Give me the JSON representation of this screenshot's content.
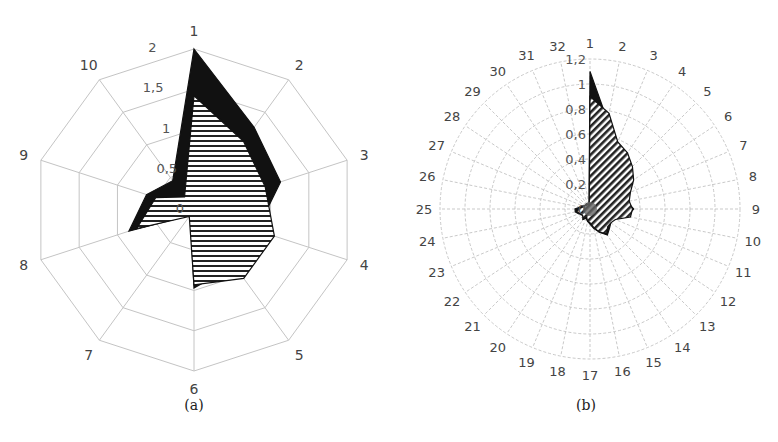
{
  "chart_data": [
    {
      "id": "a",
      "type": "radar",
      "caption": "(a)",
      "categories": [
        "1",
        "2",
        "3",
        "4",
        "5",
        "6",
        "7",
        "8",
        "9",
        "10"
      ],
      "radial_ticks": [
        "0",
        "0,5",
        "1",
        "1,5",
        "2"
      ],
      "rmax": 2,
      "grid": "polygon",
      "series": [
        {
          "name": "series-solid",
          "fill": "black",
          "values": [
            2.0,
            1.27,
            1.13,
            0.82,
            0.85,
            0.97,
            0.08,
            0.85,
            0.62,
            0.45
          ]
        },
        {
          "name": "series-hatched",
          "fill": "horizontal-hatch",
          "values": [
            1.42,
            1.05,
            0.93,
            1.05,
            1.05,
            0.93,
            0.1,
            0.75,
            0.5,
            0.2
          ]
        }
      ]
    },
    {
      "id": "b",
      "type": "radar",
      "caption": "(b)",
      "categories": [
        "1",
        "2",
        "3",
        "4",
        "5",
        "6",
        "7",
        "8",
        "9",
        "10",
        "11",
        "12",
        "13",
        "14",
        "15",
        "16",
        "17",
        "18",
        "19",
        "20",
        "21",
        "22",
        "23",
        "24",
        "25",
        "26",
        "27",
        "28",
        "29",
        "30",
        "31",
        "32"
      ],
      "radial_ticks": [
        "0",
        "0,2",
        "0,4",
        "0,6",
        "0,8",
        "1",
        "1,2"
      ],
      "rmax": 1.2,
      "grid": "circle-dashed",
      "series": [
        {
          "name": "series-solid",
          "fill": "black",
          "values": [
            1.1,
            0.72,
            0.55,
            0.5,
            0.45,
            0.4,
            0.33,
            0.3,
            0.35,
            0.3,
            0.2,
            0.2,
            0.22,
            0.25,
            0.2,
            0.16,
            0.12,
            0.1,
            0.08,
            0.1,
            0.08,
            0.08,
            0.1,
            0.12,
            0.12,
            0.08,
            0.06,
            0.05,
            0.05,
            0.05,
            0.04,
            0.04
          ]
        },
        {
          "name": "series-hatched",
          "fill": "diagonal-hatch",
          "values": [
            0.9,
            0.78,
            0.58,
            0.54,
            0.48,
            0.42,
            0.35,
            0.32,
            0.34,
            0.33,
            0.22,
            0.2,
            0.2,
            0.24,
            0.2,
            0.15,
            0.11,
            0.1,
            0.07,
            0.1,
            0.08,
            0.08,
            0.09,
            0.11,
            0.1,
            0.07,
            0.05,
            0.05,
            0.04,
            0.04,
            0.04,
            0.03
          ]
        }
      ]
    }
  ]
}
